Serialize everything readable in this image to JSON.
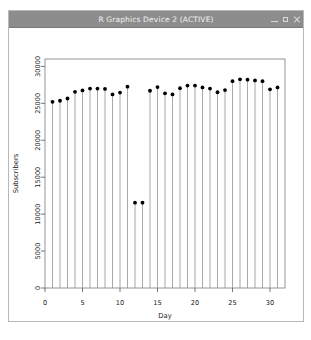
{
  "window": {
    "title": "R Graphics Device 2 (ACTIVE)",
    "controls": [
      {
        "name": "minimize-button",
        "glyph": "minimize"
      },
      {
        "name": "maximize-button",
        "glyph": "maximize"
      },
      {
        "name": "close-button",
        "glyph": "close"
      }
    ],
    "titlebar_color": "#8d8d8d",
    "border_color": "#b8b8b8",
    "background": "#ffffff"
  },
  "chart_data": {
    "type": "line",
    "plot_style": "stem",
    "title": "",
    "xlabel": "Day",
    "ylabel": "Subscribers",
    "xlim": [
      0,
      32
    ],
    "ylim": [
      0,
      31000
    ],
    "xticks": [
      0,
      5,
      10,
      15,
      20,
      25,
      30
    ],
    "yticks": [
      0,
      5000,
      10000,
      15000,
      20000,
      25000,
      30000
    ],
    "grid": false,
    "legend": null,
    "point_color": "#000000",
    "stem_color": "#8c8c8c",
    "x": [
      1,
      2,
      3,
      4,
      5,
      6,
      7,
      8,
      9,
      10,
      11,
      12,
      13,
      14,
      15,
      16,
      17,
      18,
      19,
      20,
      21,
      22,
      23,
      24,
      25,
      26,
      27,
      28,
      29,
      30,
      31
    ],
    "values": [
      25200,
      25350,
      25650,
      26550,
      26750,
      27000,
      27000,
      26950,
      26200,
      26450,
      27250,
      11550,
      11550,
      26700,
      27200,
      26350,
      26200,
      27050,
      27400,
      27400,
      27150,
      27000,
      26500,
      26800,
      28000,
      28250,
      28200,
      28100,
      28000,
      26900,
      27150
    ]
  }
}
